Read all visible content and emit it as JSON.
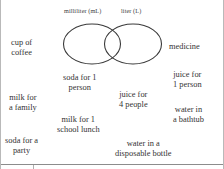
{
  "worksheet": {
    "title": "Milliliter and Liter Venn Diagram Sort",
    "venn": {
      "left_circle_label": "milliliter (mL)",
      "right_circle_label": "liter (L)",
      "left_circle_contents": [],
      "right_circle_contents": [],
      "overlap_contents": [],
      "stroke_color": "#3a3a3a"
    },
    "items": [
      {
        "id": "cup-of-coffee",
        "lines": [
          "cup of",
          "coffee"
        ]
      },
      {
        "id": "medicine",
        "lines": [
          "medicine"
        ]
      },
      {
        "id": "soda-one-person",
        "lines": [
          "soda for 1",
          "person"
        ]
      },
      {
        "id": "juice-one-person",
        "lines": [
          "juice for",
          "1 person"
        ]
      },
      {
        "id": "milk-family",
        "lines": [
          "milk for",
          "a family"
        ]
      },
      {
        "id": "juice-four-people",
        "lines": [
          "juice for",
          "4 people"
        ]
      },
      {
        "id": "water-bathtub",
        "lines": [
          "water in",
          "a bathtub"
        ]
      },
      {
        "id": "milk-school-lunch",
        "lines": [
          "milk for 1",
          "school lunch"
        ]
      },
      {
        "id": "soda-party",
        "lines": [
          "soda for a",
          "party"
        ]
      },
      {
        "id": "water-bottle",
        "lines": [
          "water in a",
          "disposable bottle"
        ]
      }
    ]
  }
}
